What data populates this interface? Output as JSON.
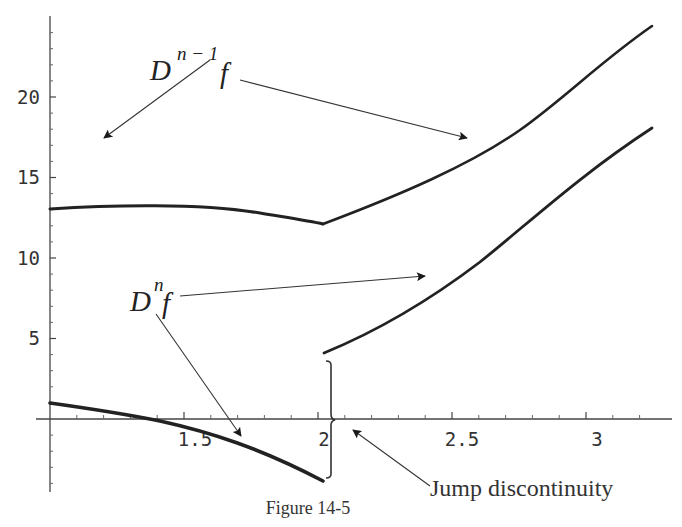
{
  "figure": {
    "caption": "Figure 14-5"
  },
  "annotations": {
    "upper_label_base": "D",
    "upper_label_sup": "n − 1",
    "upper_label_f": "f",
    "lower_label_base": "D",
    "lower_label_sup": "n",
    "lower_label_f": "f",
    "jump_label": "Jump discontinuity"
  },
  "axes": {
    "x_ticks": [
      {
        "value": 1.5,
        "label": "1.5"
      },
      {
        "value": 2,
        "label": "2"
      },
      {
        "value": 2.5,
        "label": "2.5"
      },
      {
        "value": 3,
        "label": "3"
      }
    ],
    "y_ticks": [
      {
        "value": 5,
        "label": "5"
      },
      {
        "value": 10,
        "label": "10"
      },
      {
        "value": 15,
        "label": "15"
      },
      {
        "value": 20,
        "label": "20"
      }
    ]
  },
  "colors": {
    "curve": "#222222",
    "axis": "#444444",
    "arrow": "#222222"
  },
  "chart_data": {
    "type": "line",
    "title": "Figure 14-5",
    "xlabel": "",
    "ylabel": "",
    "xlim": [
      1,
      3.2
    ],
    "ylim": [
      -4,
      25
    ],
    "grid": false,
    "legend": "none (annotations with arrows)",
    "series": [
      {
        "name": "D^(n-1) f",
        "x": [
          1.0,
          1.25,
          1.5,
          1.75,
          2.0,
          2.25,
          2.5,
          2.75,
          3.0,
          3.2
        ],
        "y": [
          13.0,
          13.2,
          13.2,
          12.9,
          12.1,
          13.6,
          15.5,
          18.0,
          21.2,
          24.3
        ]
      },
      {
        "name": "D^n f (left branch)",
        "x": [
          1.0,
          1.25,
          1.38,
          1.5,
          1.75,
          2.0
        ],
        "y": [
          1.0,
          0.4,
          0.0,
          -0.7,
          -2.1,
          -3.7
        ]
      },
      {
        "name": "D^n f (right branch)",
        "x": [
          2.0,
          2.25,
          2.5,
          2.75,
          3.0,
          3.2
        ],
        "y": [
          4.0,
          6.0,
          8.3,
          11.0,
          14.5,
          18.0
        ]
      }
    ],
    "annotations": [
      {
        "text": "D^(n-1) f",
        "arrows_to": [
          "upper curve left (x≈1.2, y≈14)",
          "upper curve right (x≈2.65, y≈17.3)"
        ]
      },
      {
        "text": "D^n f",
        "arrows_to": [
          "lower curve left (x≈1.72, y≈-1)",
          "lower curve right (x≈2.6, y≈8.6)"
        ]
      },
      {
        "text": "Jump discontinuity",
        "at_x": 2,
        "brace_from_y": -3.7,
        "brace_to_y": 4.0
      }
    ]
  }
}
